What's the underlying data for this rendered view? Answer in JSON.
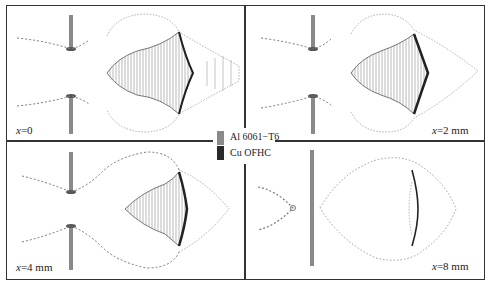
{
  "figure": {
    "panels": [
      {
        "id": "p1",
        "label_var": "x",
        "label_value": "=0"
      },
      {
        "id": "p2",
        "label_var": "x",
        "label_value": "=2 mm"
      },
      {
        "id": "p3",
        "label_var": "x",
        "label_value": "=4 mm"
      },
      {
        "id": "p4",
        "label_var": "x",
        "label_value": "=8 mm"
      }
    ],
    "legend": [
      {
        "label": "Al 6061−T6",
        "color": "#8a8a8a"
      },
      {
        "label": "Cu OFHC",
        "color": "#2a2a2a"
      }
    ],
    "colors": {
      "aluminum": "#8a8a8a",
      "copper": "#2a2a2a",
      "frame": "#333333"
    }
  }
}
